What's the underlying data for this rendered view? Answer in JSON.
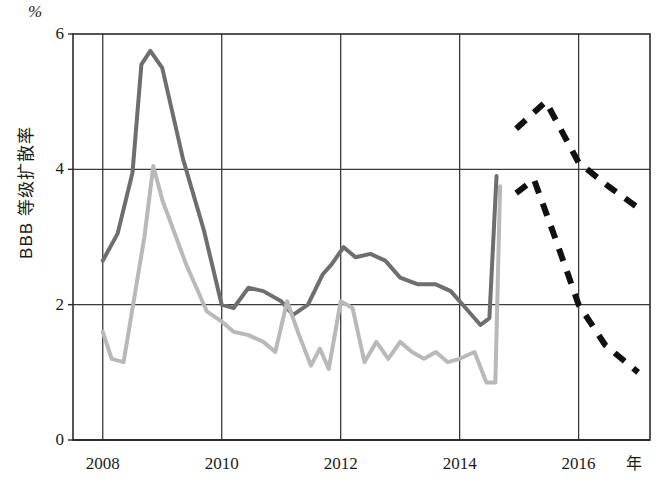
{
  "chart_data": {
    "type": "line",
    "title": "",
    "xlabel": "年",
    "ylabel": "BBB 等级扩散率",
    "unit_label": "%",
    "xlim": [
      2007.5,
      2017.2
    ],
    "ylim": [
      0,
      6
    ],
    "xticks": [
      2008,
      2010,
      2012,
      2014,
      2016
    ],
    "xtick_labels": [
      "2008",
      "2010",
      "2012",
      "2014",
      "2016"
    ],
    "yticks": [
      0,
      2,
      4,
      6
    ],
    "ytick_labels": [
      "0",
      "2",
      "4",
      "6"
    ],
    "grid": "both",
    "legend": "none",
    "colors": {
      "series_dark": "#6e6e6e",
      "series_light": "#b9b9b9",
      "forecast": "#111111",
      "axis": "#2b2b2b",
      "grid": "#3a3a3a",
      "background": "#ffffff"
    },
    "series": [
      {
        "name": "BBB 等级扩散率 (深灰实线)",
        "style": "solid",
        "color": "#6e6e6e",
        "points": [
          [
            2008.0,
            2.65
          ],
          [
            2008.25,
            3.05
          ],
          [
            2008.5,
            3.95
          ],
          [
            2008.65,
            5.55
          ],
          [
            2008.8,
            5.75
          ],
          [
            2009.0,
            5.5
          ],
          [
            2009.35,
            4.15
          ],
          [
            2009.7,
            3.1
          ],
          [
            2010.0,
            2.0
          ],
          [
            2010.2,
            1.95
          ],
          [
            2010.45,
            2.25
          ],
          [
            2010.7,
            2.2
          ],
          [
            2011.0,
            2.05
          ],
          [
            2011.2,
            1.85
          ],
          [
            2011.45,
            2.0
          ],
          [
            2011.7,
            2.45
          ],
          [
            2011.85,
            2.6
          ],
          [
            2012.05,
            2.85
          ],
          [
            2012.25,
            2.7
          ],
          [
            2012.5,
            2.75
          ],
          [
            2012.75,
            2.65
          ],
          [
            2013.0,
            2.4
          ],
          [
            2013.3,
            2.3
          ],
          [
            2013.6,
            2.3
          ],
          [
            2013.85,
            2.2
          ],
          [
            2014.1,
            1.95
          ],
          [
            2014.35,
            1.7
          ],
          [
            2014.5,
            1.8
          ],
          [
            2014.62,
            3.9
          ]
        ]
      },
      {
        "name": "BBB 等级扩散率 (浅灰实线)",
        "style": "solid",
        "color": "#b9b9b9",
        "points": [
          [
            2008.0,
            1.6
          ],
          [
            2008.15,
            1.2
          ],
          [
            2008.35,
            1.15
          ],
          [
            2008.7,
            3.0
          ],
          [
            2008.85,
            4.05
          ],
          [
            2009.0,
            3.55
          ],
          [
            2009.4,
            2.6
          ],
          [
            2009.75,
            1.9
          ],
          [
            2010.0,
            1.75
          ],
          [
            2010.2,
            1.6
          ],
          [
            2010.45,
            1.55
          ],
          [
            2010.7,
            1.45
          ],
          [
            2010.9,
            1.3
          ],
          [
            2011.1,
            2.05
          ],
          [
            2011.3,
            1.55
          ],
          [
            2011.5,
            1.1
          ],
          [
            2011.65,
            1.35
          ],
          [
            2011.8,
            1.05
          ],
          [
            2012.0,
            2.05
          ],
          [
            2012.2,
            1.95
          ],
          [
            2012.4,
            1.15
          ],
          [
            2012.6,
            1.45
          ],
          [
            2012.8,
            1.2
          ],
          [
            2013.0,
            1.45
          ],
          [
            2013.2,
            1.3
          ],
          [
            2013.4,
            1.2
          ],
          [
            2013.6,
            1.3
          ],
          [
            2013.8,
            1.15
          ],
          [
            2014.0,
            1.2
          ],
          [
            2014.25,
            1.3
          ],
          [
            2014.45,
            0.85
          ],
          [
            2014.6,
            0.85
          ],
          [
            2014.68,
            3.75
          ]
        ]
      },
      {
        "name": "预测上限 (黑色虚线)",
        "style": "dashed",
        "color": "#111111",
        "points": [
          [
            2014.95,
            4.6
          ],
          [
            2015.45,
            5.0
          ],
          [
            2016.0,
            4.1
          ],
          [
            2016.5,
            3.75
          ],
          [
            2017.05,
            3.4
          ]
        ]
      },
      {
        "name": "预测下限 (黑色虚线)",
        "style": "dashed",
        "color": "#111111",
        "points": [
          [
            2014.95,
            3.65
          ],
          [
            2015.25,
            3.85
          ],
          [
            2015.6,
            3.0
          ],
          [
            2016.0,
            2.0
          ],
          [
            2016.45,
            1.4
          ],
          [
            2017.0,
            1.0
          ]
        ]
      }
    ]
  },
  "axes": {
    "unit_label": "%",
    "y_title": "BBB 等级扩散率",
    "x_unit": "年"
  }
}
